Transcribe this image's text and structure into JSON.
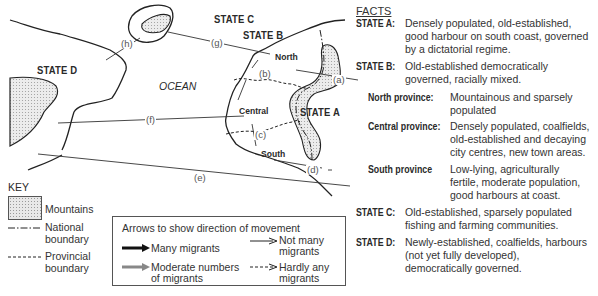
{
  "map": {
    "states": {
      "a": "STATE A",
      "b": "STATE B",
      "c": "STATE C",
      "d": "STATE D"
    },
    "provinces": {
      "north": "North",
      "central": "Central",
      "south": "South"
    },
    "ocean": "OCEAN",
    "routes": {
      "a": "(a)",
      "b": "(b)",
      "c": "(c)",
      "d": "(d)",
      "e": "(e)",
      "f": "(f)",
      "g": "(g)",
      "h": "(h)"
    }
  },
  "key": {
    "title": "KEY",
    "mountains": "Mountains",
    "national_boundary": [
      "National",
      "boundary"
    ],
    "provincial_boundary": [
      "Provincial",
      "boundary"
    ]
  },
  "arrows_legend": {
    "heading": "Arrows to show direction of movement",
    "many": "Many migrants",
    "moderate": [
      "Moderate numbers",
      "of migrants"
    ],
    "not_many": [
      "Not many",
      "migrants"
    ],
    "hardly_any": [
      "Hardly any",
      "migrants"
    ]
  },
  "facts": {
    "title": "FACTS",
    "items": [
      {
        "key": "STATE A:",
        "lines": [
          "Densely populated, old-established,",
          "good harbour on south coast, governed",
          "by a dictatorial regime."
        ]
      },
      {
        "key": "STATE B:",
        "lines": [
          "Old-established democratically",
          "governed, racially mixed."
        ]
      },
      {
        "key": "North province:",
        "lines": [
          "Mountainous and sparsely",
          "populated"
        ]
      },
      {
        "key": "Central province:",
        "lines": [
          "Densely populated, coalfields,",
          "old-established and decaying",
          "city centres, new town areas."
        ]
      },
      {
        "key": "South province",
        "lines": [
          "Low-lying, agriculturally",
          "fertile, moderate population,",
          "good harbours at coast."
        ]
      },
      {
        "key": "STATE C:",
        "lines": [
          "Old-established, sparsely populated",
          "fishing and farming communities."
        ]
      },
      {
        "key": "STATE D:",
        "lines": [
          "Newly-established, coalfields, harbours",
          "(not yet fully developed),",
          "democratically governed."
        ]
      }
    ]
  }
}
